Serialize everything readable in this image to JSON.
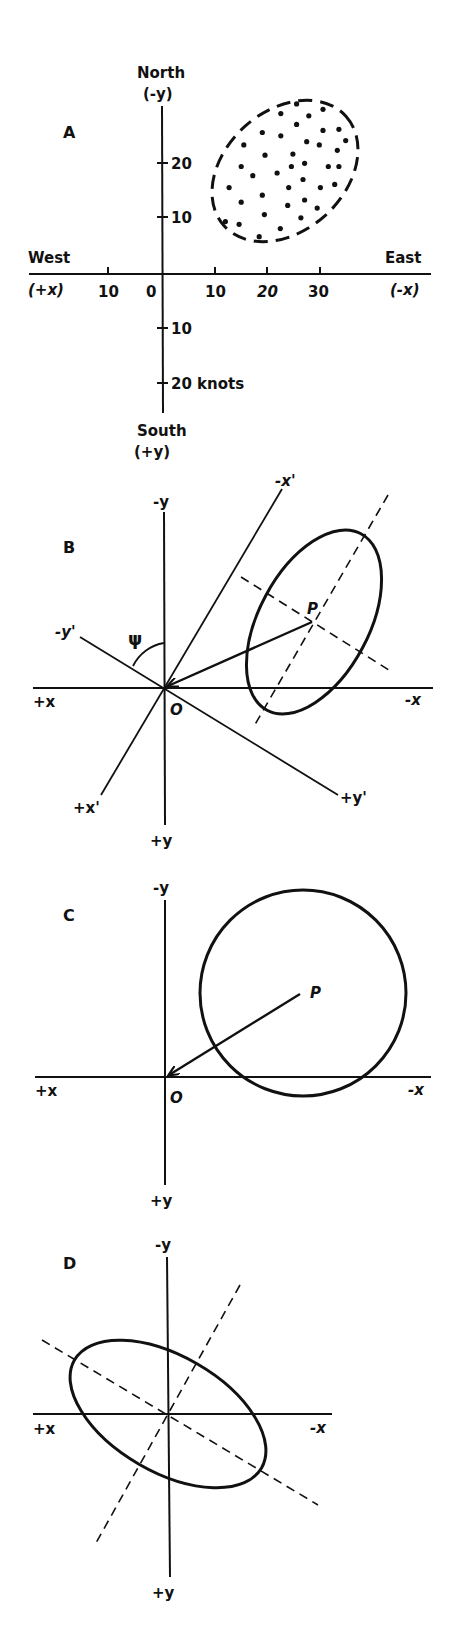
{
  "chart_data": [
    {
      "type": "scatter",
      "panel": "A",
      "title": "A",
      "axes": {
        "north_label": "North",
        "north_sub": "(-y)",
        "south_label": "South",
        "south_sub": "(+y)",
        "west_label": "West",
        "west_sub": "(+x)",
        "east_label": "East",
        "east_sub": "(-x)",
        "x_ticks": [
          "10",
          "0",
          "10",
          "20",
          "30"
        ],
        "y_ticks_north": [
          "20",
          "10"
        ],
        "y_ticks_south": [
          "10",
          "20 knots"
        ],
        "units": "knots"
      },
      "description": "Scatter of wind/current velocity points (knots) enclosed by a dashed elliptical envelope tilted NE, centered near (23 E, 15 N)",
      "ellipse_center_knots": [
        23,
        15
      ],
      "points_knots": [
        [
          25.5,
          31.5
        ],
        [
          22.5,
          29.7
        ],
        [
          27.8,
          29.3
        ],
        [
          30.5,
          30.5
        ],
        [
          25.5,
          27.7
        ],
        [
          19,
          26.2
        ],
        [
          22.5,
          25.6
        ],
        [
          30.5,
          26.6
        ],
        [
          33.5,
          26.8
        ],
        [
          15.5,
          23.9
        ],
        [
          27.4,
          24.5
        ],
        [
          29.8,
          23.9
        ],
        [
          34.8,
          24.7
        ],
        [
          19.5,
          22
        ],
        [
          24.8,
          22.2
        ],
        [
          33.2,
          22.9
        ],
        [
          27,
          20.5
        ],
        [
          15,
          19.9
        ],
        [
          24.5,
          19.9
        ],
        [
          31.5,
          19.9
        ],
        [
          33.5,
          19.9
        ],
        [
          21.8,
          18.7
        ],
        [
          17.2,
          18.2
        ],
        [
          26.7,
          17.5
        ],
        [
          12.7,
          16
        ],
        [
          24,
          16
        ],
        [
          30,
          16
        ],
        [
          32.7,
          16.6
        ],
        [
          19,
          14.6
        ],
        [
          15,
          13.3
        ],
        [
          27,
          13.7
        ],
        [
          23.8,
          12.7
        ],
        [
          29.4,
          12.2
        ],
        [
          19.4,
          11
        ],
        [
          26.3,
          10.4
        ],
        [
          12,
          9.7
        ],
        [
          14.6,
          9.2
        ],
        [
          22.4,
          8.4
        ],
        [
          18.4,
          6.9
        ]
      ]
    },
    {
      "type": "diagram",
      "panel": "B",
      "title": "B",
      "labels": {
        "neg_y": "-y",
        "pos_y": "+y",
        "pos_x": "+x",
        "neg_x": "-x",
        "neg_x_prime": "-x'",
        "pos_x_prime": "+x'",
        "neg_y_prime": "-y'",
        "pos_y_prime": "+y'",
        "origin": "O",
        "point": "P",
        "angle": "ψ"
      },
      "description": "Ellipse centered at P with rotated axes x', y' through origin O at angle ψ; arrow from P to O"
    },
    {
      "type": "diagram",
      "panel": "C",
      "title": "C",
      "labels": {
        "neg_y": "-y",
        "pos_y": "+y",
        "pos_x": "+x",
        "neg_x": "-x",
        "origin": "O",
        "point": "P"
      },
      "description": "Circle centered at P with arrow from P to origin O"
    },
    {
      "type": "diagram",
      "panel": "D",
      "title": "D",
      "labels": {
        "neg_y": "-y",
        "pos_y": "+y",
        "pos_x": "+x",
        "neg_x": "-x"
      },
      "description": "Ellipse centered at origin, major axis tilted NW-SE, with dashed principal axes"
    }
  ],
  "figure": {
    "panels": [
      "A",
      "B",
      "C",
      "D"
    ]
  }
}
